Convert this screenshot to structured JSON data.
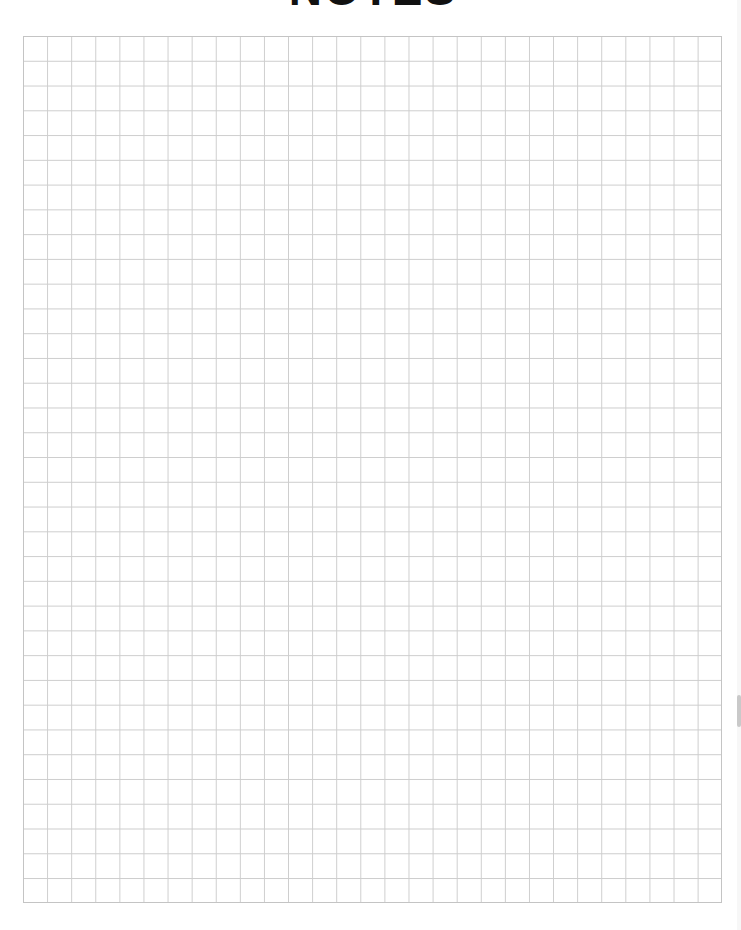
{
  "page": {
    "title": "NOTES",
    "grid": {
      "rows": 35,
      "columns": 29,
      "line_color": "#cdcdcd",
      "border_color": "#c4c4c4",
      "background": "#ffffff"
    }
  },
  "scrollbar": {
    "thumb_color": "#c9c9c9",
    "track_color": "#f7f7f7"
  }
}
